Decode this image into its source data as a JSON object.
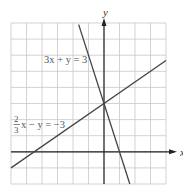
{
  "chart_data": {
    "type": "line",
    "title": "",
    "xlabel": "x",
    "ylabel": "y",
    "xlim": [
      -6,
      4
    ],
    "ylim": [
      -2,
      8
    ],
    "grid": true,
    "grid_step": 1,
    "series": [
      {
        "name": "3x + y = 3",
        "label": "3x + y = 3",
        "equation": "y = 3 - 3x",
        "slope": -3,
        "intercept": 3,
        "color": "#555555"
      },
      {
        "name": "2/3 x - y = -3",
        "label_frac_num": "2",
        "label_frac_den": "3",
        "label_rest": "x − y = −3",
        "equation": "y = (2/3)x + 3",
        "slope": 0.6667,
        "intercept": 3,
        "color": "#444444"
      }
    ],
    "intersection": [
      0,
      3
    ]
  }
}
